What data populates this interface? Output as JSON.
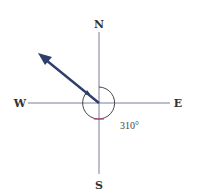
{
  "diagram": {
    "labels": {
      "north": "N",
      "south": "S",
      "east": "E",
      "west": "W"
    },
    "angle_label": "310°",
    "bearing_degrees": 310,
    "colors": {
      "axis": "#7a7f99",
      "arrow": "#2e3f6e",
      "arc": "#333333",
      "arc_marker": "#c0408a"
    }
  }
}
